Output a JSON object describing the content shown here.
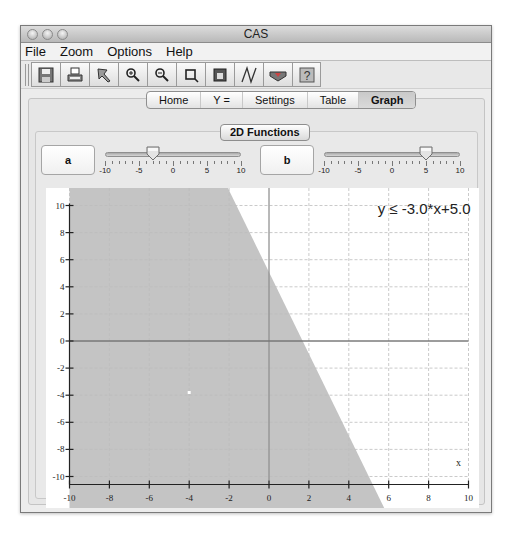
{
  "window": {
    "title": "CAS",
    "traffic_lights": [
      "close",
      "minimize",
      "zoom"
    ]
  },
  "menubar": {
    "items": [
      {
        "label": "File"
      },
      {
        "label": "Zoom"
      },
      {
        "label": "Options"
      },
      {
        "label": "Help"
      }
    ]
  },
  "toolbar": {
    "buttons": [
      {
        "icon": "save-icon"
      },
      {
        "icon": "print-icon"
      },
      {
        "icon": "select-icon"
      },
      {
        "icon": "zoom-in-icon"
      },
      {
        "icon": "zoom-out-icon"
      },
      {
        "icon": "crop-icon"
      },
      {
        "icon": "calendar-icon"
      },
      {
        "icon": "graph-curve-icon"
      },
      {
        "icon": "arrow-banner-icon"
      },
      {
        "icon": "help-icon"
      }
    ]
  },
  "tabs": {
    "items": [
      {
        "label": "Home"
      },
      {
        "label": "Y ="
      },
      {
        "label": "Settings"
      },
      {
        "label": "Table"
      },
      {
        "label": "Graph",
        "active": true
      }
    ]
  },
  "panel": {
    "title": "2D Functions"
  },
  "sliders": {
    "a": {
      "label": "a",
      "min": -10,
      "max": 10,
      "value": -3,
      "tick_labels": [
        "-10",
        "-5",
        "0",
        "5",
        "10"
      ]
    },
    "b": {
      "label": "b",
      "min": -10,
      "max": 10,
      "value": 5,
      "tick_labels": [
        "-10",
        "-5",
        "0",
        "5",
        "10"
      ]
    }
  },
  "graph": {
    "equation": "y ≤ -3.0*x+5.0",
    "equation_parts": {
      "lhs": "y",
      "op": "≤",
      "rhs": "-3.0*x+5.0"
    },
    "x_axis_label": "x",
    "x_ticks": [
      "-10",
      "-8",
      "-6",
      "-4",
      "-2",
      "0",
      "2",
      "4",
      "6",
      "8",
      "10"
    ],
    "y_ticks": [
      "10",
      "8",
      "6",
      "4",
      "2",
      "0",
      "-2",
      "-4",
      "-6",
      "-8",
      "-10"
    ],
    "shade_color": "#c4c4c4",
    "grid_color": "#bdbdbd"
  }
}
